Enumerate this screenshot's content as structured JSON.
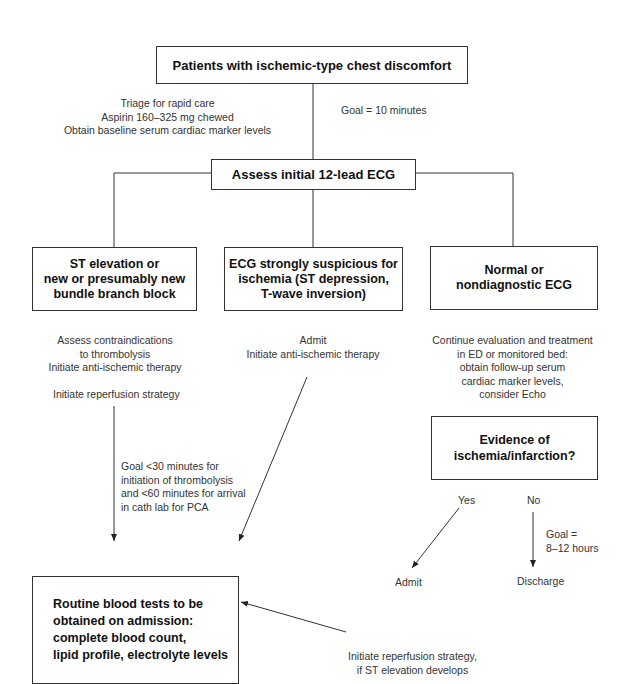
{
  "diagram": {
    "start_box": "Patients with ischemic-type chest discomfort",
    "triage_notes": [
      "Triage for rapid care",
      "Aspirin 160–325 mg chewed",
      "Obtain baseline serum cardiac marker levels"
    ],
    "goal_ecg": "Goal = 10 minutes",
    "ecg_box": "Assess initial 12-lead ECG",
    "branches": [
      {
        "box": [
          "ST elevation or",
          "new or presumably new",
          "bundle branch block"
        ],
        "notes": [
          "Assess contraindications",
          "to thrombolysis",
          "Initiate anti-ischemic therapy"
        ],
        "notes2": "Initiate reperfusion strategy",
        "goal": [
          "Goal <30 minutes for",
          "initiation of thrombolysis",
          "and <60 minutes for arrival",
          "in cath lab for PCA"
        ]
      },
      {
        "box": [
          "ECG strongly suspicious for",
          "ischemia (ST depression,",
          "T-wave inversion)"
        ],
        "notes": [
          "Admit",
          "Initiate anti-ischemic therapy"
        ]
      },
      {
        "box": [
          "Normal or",
          "nondiagnostic ECG"
        ],
        "notes": [
          "Continue evaluation and treatment",
          "in ED or monitored bed:",
          "obtain follow-up serum",
          "cardiac marker levels,",
          "consider Echo"
        ]
      }
    ],
    "evidence_box": [
      "Evidence of",
      "ischemia/infarction?"
    ],
    "yes_label": "Yes",
    "no_label": "No",
    "goal_discharge": [
      "Goal =",
      "8–12 hours"
    ],
    "admit_label": "Admit",
    "discharge_label": "Discharge",
    "routine_box": [
      "Routine blood tests to be",
      "obtained on admission:",
      "complete blood count,",
      "lipid profile, electrolyte levels"
    ],
    "reperfusion_note": [
      "Initiate reperfusion strategy,",
      "if ST elevation develops"
    ]
  }
}
